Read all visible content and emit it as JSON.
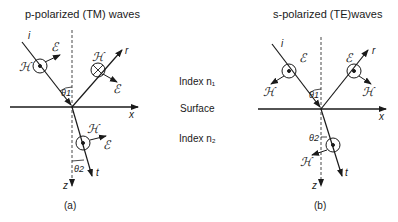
{
  "panel_a": {
    "title": "p-polarized (TM) waves",
    "caption": "(a)",
    "labels": {
      "incident": "i",
      "reflected": "r",
      "transmitted": "t",
      "x_axis": "x",
      "z_axis": "z",
      "theta1": "θ1",
      "theta2": "θ2",
      "E": "ℰ",
      "H": "ℋ"
    }
  },
  "panel_b": {
    "title": "s-polarized (TE)waves",
    "caption": "(b)",
    "labels": {
      "incident": "i",
      "reflected": "r",
      "transmitted": "t",
      "x_axis": "x",
      "z_axis": "z",
      "theta1": "θ1",
      "theta2": "θ2",
      "E": "ℰ",
      "H": "ℋ"
    }
  },
  "middle": {
    "index1": "Index n₁",
    "surface": "Surface",
    "index2": "Index n₂"
  }
}
